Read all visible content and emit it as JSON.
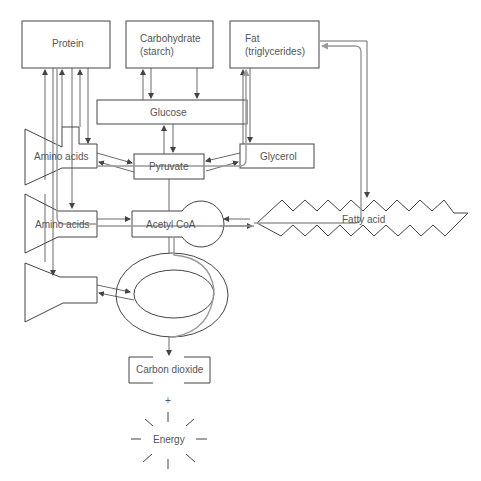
{
  "diagram": {
    "nodes": {
      "protein": "Protein",
      "carbohydrate_line1": "Carbohydrate",
      "carbohydrate_line2": "(starch)",
      "fat_line1": "Fat",
      "fat_line2": "(triglycerides)",
      "glucose": "Glucose",
      "amino_acids_1": "Amino acids",
      "amino_acids_2": "Amino acids",
      "pyruvate": "Pyruvate",
      "glycerol": "Glycerol",
      "acetyl_coa": "Acetyl CoA",
      "fatty_acid": "Fatty acid",
      "carbon_dioxide": "Carbon dioxide",
      "plus": "+",
      "energy": "Energy"
    },
    "colors": {
      "line": "#444444",
      "pathway": "#999999",
      "text": "#555555"
    }
  }
}
